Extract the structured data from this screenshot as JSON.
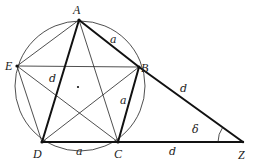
{
  "diagram": {
    "colors": {
      "stroke": "#222222",
      "background": "#ffffff"
    },
    "circle": {
      "cx": 80,
      "cy": 86,
      "r": 65
    },
    "center_dot": {
      "x": 78,
      "y": 87
    },
    "points": {
      "A": {
        "x": 79,
        "y": 20,
        "label": "A",
        "lx": 73,
        "ly": 14
      },
      "B": {
        "x": 139,
        "y": 67,
        "label": "B",
        "lx": 141,
        "ly": 68
      },
      "C": {
        "x": 118,
        "y": 142,
        "label": "C",
        "lx": 114,
        "ly": 158
      },
      "D": {
        "x": 42,
        "y": 142,
        "label": "D",
        "lx": 33,
        "ly": 158
      },
      "E": {
        "x": 17,
        "y": 66,
        "label": "E",
        "lx": 6,
        "ly": 70
      },
      "Z": {
        "x": 243,
        "y": 142,
        "label": "Z",
        "lx": 238,
        "ly": 158
      }
    },
    "edge_labels": [
      {
        "text": "a",
        "x": 110,
        "y": 43
      },
      {
        "text": "d",
        "x": 51,
        "y": 82
      },
      {
        "text": "a",
        "x": 121,
        "y": 104
      },
      {
        "text": "a",
        "x": 76,
        "y": 155
      },
      {
        "text": "d",
        "x": 180,
        "y": 90
      },
      {
        "text": "d",
        "x": 169,
        "y": 155
      }
    ],
    "angle": {
      "label": "δ",
      "lx": 192,
      "ly": 126
    }
  }
}
